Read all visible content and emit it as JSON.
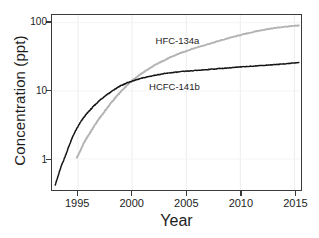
{
  "chart_data": {
    "type": "line",
    "title": "",
    "xlabel": "Year",
    "ylabel": "Concentration (ppt)",
    "yscale": "log",
    "xlim": [
      1992.6,
      2015.6
    ],
    "ylim": [
      0.35,
      130
    ],
    "grid": true,
    "grid_axis": "x",
    "legend_position": "inline-annotation",
    "xticks": [
      1995,
      2000,
      2005,
      2010,
      2015
    ],
    "xtick_labels": [
      "1995",
      "2000",
      "2005",
      "2010",
      "2015"
    ],
    "yticks": [
      1,
      10,
      100
    ],
    "ytick_labels": [
      "1",
      "10",
      "100"
    ],
    "series": [
      {
        "name": "HFC-134a",
        "color": "#b3b3b3",
        "label_x": 2004.2,
        "label_y": 52,
        "x": [
          1994.9,
          1995.1,
          1995.3,
          1995.5,
          1995.7,
          1995.9,
          1996.1,
          1996.3,
          1996.5,
          1996.7,
          1996.9,
          1997.1,
          1997.3,
          1997.5,
          1997.7,
          1997.9,
          1998.1,
          1998.3,
          1998.5,
          1998.7,
          1998.9,
          1999.1,
          1999.3,
          1999.5,
          1999.7,
          1999.9,
          2000.2,
          2000.5,
          2000.8,
          2001.1,
          2001.4,
          2001.7,
          2002.0,
          2002.3,
          2002.6,
          2002.9,
          2003.2,
          2003.5,
          2003.8,
          2004.1,
          2004.4,
          2004.7,
          2005.0,
          2005.5,
          2006.0,
          2006.5,
          2007.0,
          2007.5,
          2008.0,
          2008.5,
          2009.0,
          2009.5,
          2010.0,
          2010.5,
          2011.0,
          2011.5,
          2012.0,
          2012.5,
          2013.0,
          2013.5,
          2014.0,
          2014.5,
          2015.0,
          2015.4
        ],
        "y": [
          1.05,
          1.2,
          1.42,
          1.66,
          1.9,
          2.15,
          2.4,
          2.7,
          3.05,
          3.4,
          3.8,
          4.2,
          4.6,
          5.1,
          5.6,
          6.2,
          6.8,
          7.4,
          8.1,
          8.8,
          9.5,
          10.3,
          11.1,
          12.0,
          12.9,
          13.8,
          15.0,
          16.3,
          17.6,
          19.0,
          20.4,
          21.8,
          23.3,
          24.8,
          26.3,
          27.8,
          29.3,
          30.9,
          32.4,
          34.0,
          35.5,
          37.0,
          38.5,
          41.0,
          43.5,
          46.0,
          48.5,
          51.0,
          54.0,
          57.0,
          60.0,
          63.0,
          66.0,
          69.0,
          72.0,
          75.0,
          78.0,
          80.5,
          83.0,
          85.0,
          87.0,
          88.5,
          90.0,
          91.0
        ]
      },
      {
        "name": "HCFC-141b",
        "color": "#141414",
        "label_x": 2003.6,
        "label_y": 11.2,
        "x": [
          1992.9,
          1993.1,
          1993.3,
          1993.5,
          1993.7,
          1993.9,
          1994.1,
          1994.3,
          1994.5,
          1994.7,
          1994.9,
          1995.1,
          1995.3,
          1995.5,
          1995.7,
          1995.9,
          1996.1,
          1996.3,
          1996.5,
          1996.7,
          1996.9,
          1997.1,
          1997.3,
          1997.5,
          1997.7,
          1997.9,
          1998.1,
          1998.3,
          1998.5,
          1998.7,
          1998.9,
          1999.1,
          1999.3,
          1999.5,
          1999.7,
          1999.9,
          2000.2,
          2000.5,
          2000.8,
          2001.1,
          2001.4,
          2001.7,
          2002.0,
          2002.3,
          2002.6,
          2002.9,
          2003.2,
          2003.5,
          2003.8,
          2004.1,
          2004.5,
          2005.0,
          2005.5,
          2006.0,
          2006.5,
          2007.0,
          2007.5,
          2008.0,
          2008.5,
          2009.0,
          2009.5,
          2010.0,
          2010.5,
          2011.0,
          2011.5,
          2012.0,
          2012.5,
          2013.0,
          2013.5,
          2014.0,
          2014.5,
          2015.0,
          2015.4
        ],
        "y": [
          0.42,
          0.52,
          0.66,
          0.82,
          0.98,
          1.18,
          1.45,
          1.75,
          2.1,
          2.45,
          2.8,
          3.2,
          3.6,
          4.0,
          4.4,
          4.8,
          5.2,
          5.6,
          6.1,
          6.5,
          7.0,
          7.5,
          7.9,
          8.4,
          8.9,
          9.3,
          9.8,
          10.3,
          10.8,
          11.3,
          11.8,
          12.2,
          12.6,
          13.0,
          13.4,
          13.7,
          14.2,
          14.7,
          15.2,
          15.6,
          16.0,
          16.4,
          16.8,
          17.2,
          17.5,
          17.8,
          18.1,
          18.4,
          18.6,
          18.8,
          19.1,
          19.4,
          19.7,
          20.0,
          20.3,
          20.6,
          20.9,
          21.2,
          21.5,
          21.8,
          22.1,
          22.4,
          22.7,
          23.0,
          23.3,
          23.6,
          23.9,
          24.2,
          24.5,
          24.9,
          25.3,
          25.7,
          26.0
        ]
      }
    ]
  }
}
